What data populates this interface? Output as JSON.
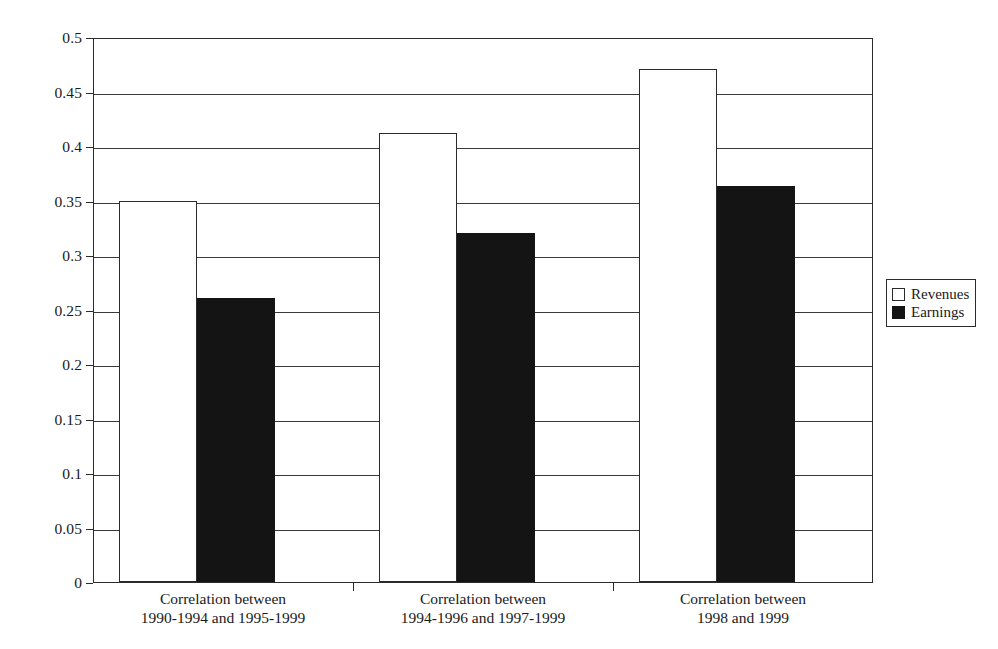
{
  "chart_data": {
    "type": "bar",
    "title": "",
    "subtitle": "",
    "xlabel": "",
    "ylabel": "",
    "ylim": [
      0,
      0.5
    ],
    "grid": true,
    "legend_position": "right",
    "categories": [
      "Correlation between\n1990-1994 and 1995-1999",
      "Correlation between\n1994-1996 and 1997-1999",
      "Correlation between\n1998 and 1999"
    ],
    "series": [
      {
        "name": "Revenues",
        "color": "#ffffff",
        "values": [
          0.35,
          0.412,
          0.471
        ]
      },
      {
        "name": "Earnings",
        "color": "#141414",
        "values": [
          0.261,
          0.32,
          0.363
        ]
      }
    ],
    "yticks": [
      "0",
      "0.05",
      "0.1",
      "0.15",
      "0.2",
      "0.25",
      "0.3",
      "0.35",
      "0.4",
      "0.45",
      "0.5"
    ],
    "ytick_values": [
      0,
      0.05,
      0.1,
      0.15,
      0.2,
      0.25,
      0.3,
      0.35,
      0.4,
      0.45,
      0.5
    ]
  },
  "legend": {
    "items": [
      {
        "label": "Revenues",
        "swatch": "hollow-square-icon"
      },
      {
        "label": "Earnings",
        "swatch": "filled-square-icon"
      }
    ]
  },
  "axis": {
    "y_labels": [
      "0.5",
      "0.45",
      "0.4",
      "0.35",
      "0.3",
      "0.25",
      "0.2",
      "0.15",
      "0.1",
      "0.05",
      "0"
    ],
    "x_labels": [
      {
        "line1": "Correlation between",
        "line2": "1990-1994 and 1995-1999"
      },
      {
        "line1": "Correlation between",
        "line2": "1994-1996 and 1997-1999"
      },
      {
        "line1": "Correlation between",
        "line2": "1998 and 1999"
      }
    ]
  },
  "colors": {
    "revenues": "#ffffff",
    "earnings": "#141414",
    "axis": "#2b2b2b",
    "grid": "#3a3a3a",
    "background": "#ffffff"
  }
}
